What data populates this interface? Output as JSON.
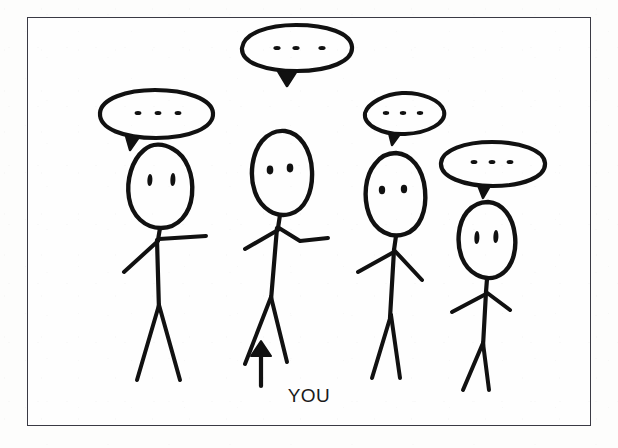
{
  "image": {
    "title": "Stick figures with ellipsis speech bubbles",
    "medium": "hand-drawn ink sketch on paper",
    "background_color": "#fefefe",
    "ink_color": "#111111",
    "frame_color": "#3a3a44"
  },
  "annotation": {
    "arrow_label": "YOU",
    "arrow_direction": "up",
    "arrow_points_to": "figure-2"
  },
  "bubbles": [
    {
      "id": "bubble-1",
      "text": "...",
      "dots": 3,
      "owner": "figure-1",
      "tail": "down-left"
    },
    {
      "id": "bubble-2",
      "text": "...",
      "dots": 3,
      "owner": "figure-2",
      "tail": "down-center"
    },
    {
      "id": "bubble-3",
      "text": "...",
      "dots": 3,
      "owner": "figure-3",
      "tail": "down-left"
    },
    {
      "id": "bubble-4",
      "text": "...",
      "dots": 3,
      "owner": "figure-4",
      "tail": "down-left"
    }
  ],
  "figures": [
    {
      "id": "figure-1",
      "label": "stick-figure-left",
      "eyes": 2,
      "mouth": false,
      "is_you": false
    },
    {
      "id": "figure-2",
      "label": "stick-figure-you",
      "eyes": 2,
      "mouth": false,
      "is_you": true
    },
    {
      "id": "figure-3",
      "label": "stick-figure-center-right",
      "eyes": 2,
      "mouth": false,
      "is_you": false
    },
    {
      "id": "figure-4",
      "label": "stick-figure-right",
      "eyes": 2,
      "mouth": false,
      "is_you": false
    }
  ]
}
